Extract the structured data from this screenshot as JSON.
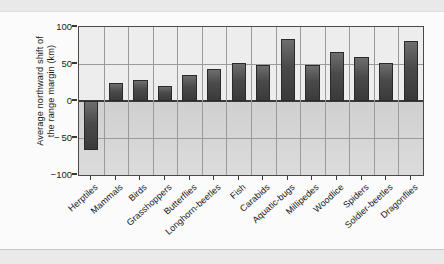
{
  "chart_data": {
    "type": "bar",
    "title": "",
    "subtitle": "",
    "xlabel": "",
    "ylabel": "Average northward shift of the range margin (km)",
    "ylabel_lines": [
      "Average northward shift of",
      "the range margin (km)"
    ],
    "ylim": [
      -100,
      100
    ],
    "yticks": [
      100,
      50,
      0,
      -50,
      -100
    ],
    "ytick_labels": [
      "100",
      "50",
      "0",
      "− 50",
      "−100"
    ],
    "grid": "both",
    "legend": "none",
    "categories": [
      "Herptiles",
      "Mammals",
      "Birds",
      "Grasshoppers",
      "Butterflies",
      "Longhorn-beetles",
      "Fish",
      "Carabids",
      "Aquatic-bugs",
      "Millipedes",
      "Woodlice",
      "Spiders",
      "Soldier-beetles",
      "Dragonflies"
    ],
    "values": [
      -66,
      24,
      29,
      20,
      35,
      43,
      51,
      48,
      84,
      49,
      66,
      60,
      51,
      81
    ],
    "bar_color": "#4a4a4a",
    "plot_background": "#ededed",
    "grid_color": "#9a9a9a",
    "axis_color": "#3a3a3a"
  }
}
